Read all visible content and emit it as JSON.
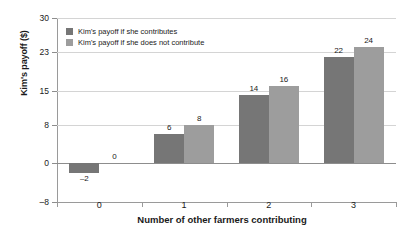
{
  "chart_data": {
    "type": "bar",
    "title": "",
    "xlabel": "Number of other farmers contributing",
    "ylabel": "Kim's payoff ($)",
    "categories": [
      "0",
      "1",
      "2",
      "3"
    ],
    "series": [
      {
        "name": "Kim's payoff if she contributes",
        "color": "#767676",
        "values": [
          -2,
          6,
          14,
          22
        ],
        "labels": [
          "–2",
          "6",
          "14",
          "22"
        ]
      },
      {
        "name": "Kim's payoff if she does not contribute",
        "color": "#9d9d9d",
        "values": [
          0,
          8,
          16,
          24
        ],
        "labels": [
          "0",
          "8",
          "16",
          "24"
        ]
      }
    ],
    "ylim": [
      -8,
      30
    ],
    "yticks": [
      30,
      23,
      15,
      8,
      0,
      -8
    ],
    "ytick_labels": [
      "30",
      "23",
      "15",
      "8",
      "0",
      "–8"
    ],
    "grid": true,
    "legend_position": "top-left"
  }
}
